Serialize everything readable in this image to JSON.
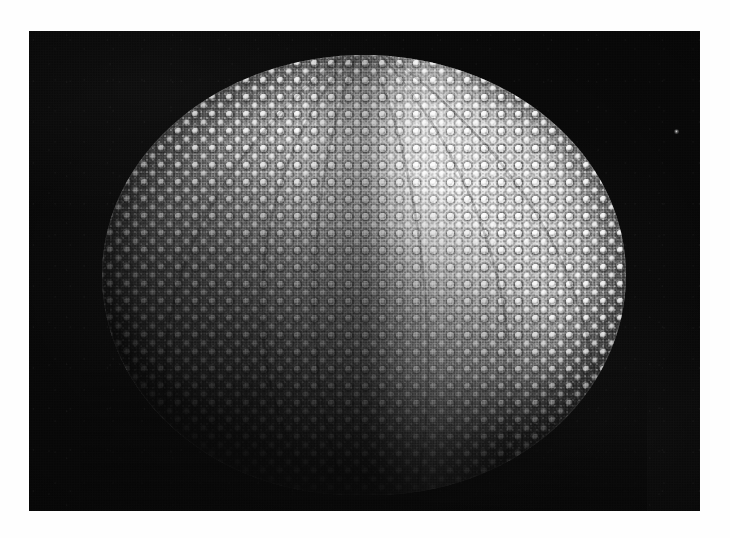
{
  "page": {
    "width": 730,
    "height": 538,
    "background_color": "#fefefe",
    "kind": "halftone-photographic-plate"
  },
  "plate": {
    "label": "sea-urchin-test-photograph",
    "x": 29,
    "y": 31,
    "width": 671,
    "height": 480,
    "background_color": "#0a0a0a",
    "border": "none",
    "print_process": "halftone-screen"
  },
  "subject": {
    "name": "sea urchin test",
    "description": "Denuded echinoid test (shell) photographed against a black background, lit strongly from the upper right so the lower-left limb falls into deep shadow.",
    "shape": "oblate spheroid",
    "surface_features": [
      "primary tubercles with dark areole rings",
      "secondary tubercles",
      "miliary granules",
      "meridional ambulacral and interambulacral bands"
    ],
    "center_x": 364,
    "center_y": 275,
    "radius_x": 262,
    "radius_y": 220,
    "highlight_color": "#f2f2f2",
    "midtone_color": "#9a9a9a",
    "shadow_color": "#1c1c1c"
  },
  "lighting": {
    "key_light_direction": "upper-right",
    "highlight_position_pct": [
      68,
      30
    ],
    "shadow_position_pct": [
      30,
      78
    ]
  },
  "bands": {
    "bright_meridian_center_pct": 63,
    "dark_suture_center_pct": 48
  },
  "artifacts": {
    "dust_speck": {
      "name": "dust-speck",
      "x": 676,
      "y": 131,
      "size": 5,
      "color": "#ebebeb"
    }
  }
}
